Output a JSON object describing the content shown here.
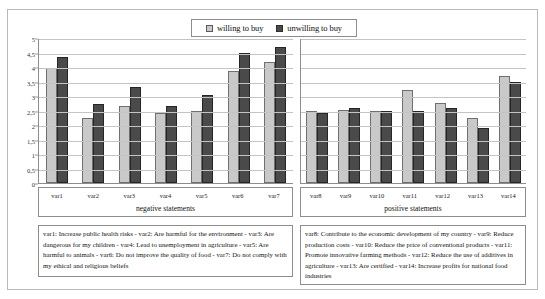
{
  "legend": {
    "items": [
      {
        "label": "willing to buy",
        "swatch": "light-gray-square-icon",
        "color": "#c9c9c9"
      },
      {
        "label": "unwilling to buy",
        "swatch": "dark-gray-square-icon",
        "color": "#4a4a4a"
      }
    ]
  },
  "axis": {
    "y_ticks": [
      "0",
      "0,5",
      "1",
      "1,5",
      "2",
      "2,5",
      "3",
      "3,5",
      "4",
      "4,5",
      "5"
    ]
  },
  "panels": {
    "negative": {
      "title": "negative statements",
      "categories": [
        "var1",
        "var2",
        "var3",
        "var4",
        "var5",
        "var6",
        "var7"
      ],
      "caption": "var1: Increase public health risks - var2: Are harmful for the environment - var3: Are dangerous for my children - var4: Lead to unemployment in agriculture - var5: Are harmful to animals - var6: Do not improve the quality of food - var7: Do not comply with my ethical and religious beliefs"
    },
    "positive": {
      "title": "positive statements",
      "categories": [
        "var8",
        "var9",
        "var10",
        "var11",
        "var12",
        "var13",
        "var14"
      ],
      "caption": "var8: Contribute to the economic development of my country - var9: Reduce production costs - var10: Reduce the price of conventional products - var11: Promote innovative farming methods - var12: Reduce the use of additives in agriculture - var13: Are certified - var14: Increase profits for national food industries"
    }
  },
  "chart_data": {
    "type": "bar",
    "title": "",
    "xlabel": "",
    "ylabel": "",
    "ylim": [
      0,
      5
    ],
    "ytick_step": 0.5,
    "grid": true,
    "legend_position": "top-center",
    "categories": [
      "var1",
      "var2",
      "var3",
      "var4",
      "var5",
      "var6",
      "var7",
      "var8",
      "var9",
      "var10",
      "var11",
      "var12",
      "var13",
      "var14"
    ],
    "groups": [
      {
        "name": "negative statements",
        "categories": [
          "var1",
          "var2",
          "var3",
          "var4",
          "var5",
          "var6",
          "var7"
        ]
      },
      {
        "name": "positive statements",
        "categories": [
          "var8",
          "var9",
          "var10",
          "var11",
          "var12",
          "var13",
          "var14"
        ]
      }
    ],
    "series": [
      {
        "name": "willing to buy",
        "color": "#c9c9c9",
        "values": [
          3.95,
          2.25,
          2.67,
          2.42,
          2.47,
          3.85,
          4.17,
          2.5,
          2.53,
          2.5,
          3.2,
          2.75,
          2.24,
          3.68
        ]
      },
      {
        "name": "unwilling to buy",
        "color": "#4a4a4a",
        "values": [
          4.35,
          2.72,
          3.3,
          2.67,
          3.03,
          4.47,
          4.68,
          2.42,
          2.6,
          2.48,
          2.5,
          2.6,
          1.88,
          3.5
        ]
      }
    ]
  }
}
